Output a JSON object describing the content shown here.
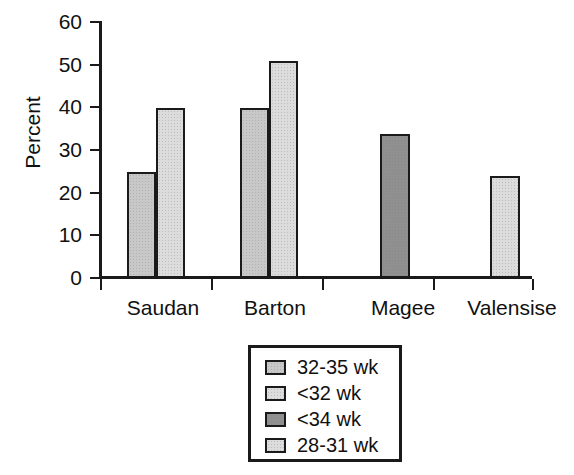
{
  "chart_data": {
    "type": "bar",
    "title": "",
    "subtitle": "",
    "xlabel": "",
    "ylabel": "Percent",
    "ylim": [
      0,
      60
    ],
    "yticks": [
      0,
      10,
      20,
      30,
      40,
      50,
      60
    ],
    "ytick_labels": [
      "0",
      "10",
      "20",
      "30",
      "40",
      "50",
      "60"
    ],
    "categories": [
      "Saudan",
      "Barton",
      "Magee",
      "Valensise"
    ],
    "grid": false,
    "legend_position": "below-center",
    "legend_entries": [
      "32-35 wk",
      "<32 wk",
      "<34 wk",
      "28-31 wk"
    ],
    "series": [
      {
        "name": "32-35 wk",
        "color": "#c8c8c8",
        "values": [
          24.8,
          39.8,
          null,
          null
        ]
      },
      {
        "name": "<32 wk",
        "color": "#dcdcdc",
        "values": [
          39.8,
          50.8,
          null,
          null
        ]
      },
      {
        "name": "<34 wk",
        "color": "#909090",
        "values": [
          null,
          null,
          33.7,
          null
        ]
      },
      {
        "name": "28-31 wk",
        "color": "#dcdcdc",
        "values": [
          null,
          null,
          null,
          23.8
        ]
      }
    ],
    "bars": [
      {
        "category": "Saudan",
        "series": "32-35 wk",
        "value": 24.8,
        "color": "#c8c8c8",
        "x": 127,
        "width": 29
      },
      {
        "category": "Saudan",
        "series": "<32 wk",
        "value": 39.8,
        "color": "#dcdcdc",
        "x": 156,
        "width": 29
      },
      {
        "category": "Barton",
        "series": "32-35 wk",
        "value": 39.8,
        "color": "#c8c8c8",
        "x": 240,
        "width": 29
      },
      {
        "category": "Barton",
        "series": "<32 wk",
        "value": 50.8,
        "color": "#dcdcdc",
        "x": 269,
        "width": 29
      },
      {
        "category": "Magee",
        "series": "<34 wk",
        "value": 33.7,
        "color": "#909090",
        "x": 380,
        "width": 30
      },
      {
        "category": "Valensise",
        "series": "28-31 wk",
        "value": 23.8,
        "color": "#dcdcdc",
        "x": 490,
        "width": 30
      }
    ],
    "xticks_px": [
      100,
      211,
      322,
      433,
      532
    ],
    "category_label_centers_px": [
      163,
      275,
      403,
      512
    ]
  },
  "colors": {
    "axis": "#1a1a1a",
    "background": "#ffffff",
    "bar_medium_gray": "#c8c8c8",
    "bar_light_gray": "#dcdcdc",
    "bar_dark_gray": "#909090"
  }
}
